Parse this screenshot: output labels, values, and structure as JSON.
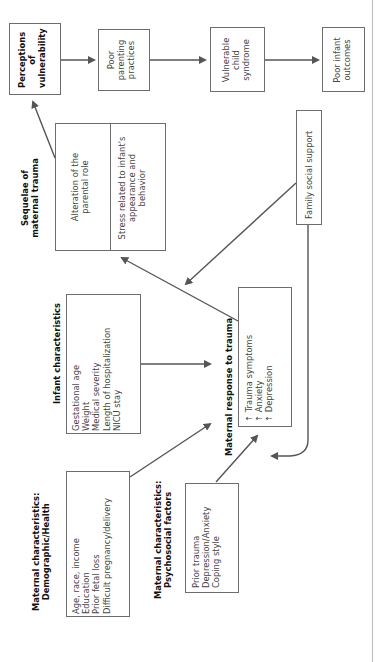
{
  "diagram": {
    "orientation": "rotated-90-ccw",
    "nodes": {
      "perceptions": {
        "label_lines": [
          "Perceptions",
          "of",
          "vulnerability"
        ]
      },
      "poor_parenting": {
        "label_lines": [
          "Poor",
          "parenting",
          "practices"
        ]
      },
      "vulnerable_child": {
        "label_lines": [
          "Vulnerable",
          "child",
          "syndrome"
        ]
      },
      "poor_outcomes": {
        "label_lines": [
          "Poor infant",
          "outcomes"
        ]
      },
      "sequelae": {
        "title_lines": [
          "Sequelae of",
          "maternal trauma"
        ],
        "items": [
          {
            "lines": [
              "Alteration of the",
              "parental role"
            ]
          },
          {
            "lines": [
              "Stress related to infant's",
              "appearance and",
              "behavior"
            ]
          }
        ]
      },
      "family_support": {
        "label": "Family social support"
      },
      "infant": {
        "title": "Infant characteristics",
        "items": [
          "Gestational age",
          "Weight",
          "Medical severity",
          "Length of hospitalization",
          "NICU stay"
        ]
      },
      "maternal_response": {
        "title": "Maternal response to trauma",
        "items": [
          {
            "arrow": "↑",
            "text": "Trauma symptoms"
          },
          {
            "arrow": "↑",
            "text": "Anxiety"
          },
          {
            "arrow": "↑",
            "text": "Depression"
          }
        ]
      },
      "demographic": {
        "title_lines": [
          "Maternal characteristics:",
          "Demographic/Health"
        ],
        "items": [
          "Age, race, income",
          "Education",
          "Prior fetal loss",
          "Difficult pregnancy/delivery"
        ]
      },
      "psychosocial": {
        "title_lines": [
          "Maternal characteristics:",
          "Psychosocial factors"
        ],
        "items": [
          "Prior trauma",
          "Depression/Anxiety",
          "Coping style"
        ]
      }
    },
    "colors": {
      "line": "#555555",
      "box_border": "#6d6d6d",
      "text": "#3a3a3a"
    }
  }
}
